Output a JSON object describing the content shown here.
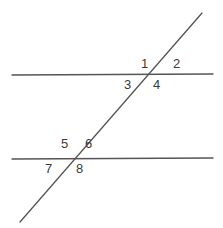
{
  "diagram": {
    "type": "geometry-figure",
    "background_color": "#ffffff",
    "line_color": "#555555",
    "label_color": "#3a3a3a",
    "lines": [
      {
        "name": "upper-parallel-line",
        "role": "parallel-line",
        "x1": 12,
        "y1": 75,
        "x2": 213,
        "y2": 74
      },
      {
        "name": "lower-parallel-line",
        "role": "parallel-line",
        "x1": 12,
        "y1": 159,
        "x2": 213,
        "y2": 158
      },
      {
        "name": "transversal-line",
        "role": "transversal",
        "x1": 20,
        "y1": 222,
        "x2": 202,
        "y2": 13
      }
    ],
    "intersections": [
      {
        "name": "upper-intersection",
        "x": 150,
        "y": 75
      },
      {
        "name": "lower-intersection",
        "x": 72,
        "y": 159
      }
    ],
    "labels": [
      {
        "id": "1",
        "text": "1",
        "x": 141,
        "y": 57,
        "position": "upper-left-of-upper-intersection"
      },
      {
        "id": "2",
        "text": "2",
        "x": 173,
        "y": 57,
        "position": "upper-right-of-upper-intersection"
      },
      {
        "id": "3",
        "text": "3",
        "x": 124,
        "y": 78,
        "position": "lower-left-of-upper-intersection"
      },
      {
        "id": "4",
        "text": "4",
        "x": 153,
        "y": 78,
        "position": "lower-right-of-upper-intersection"
      },
      {
        "id": "5",
        "text": "5",
        "x": 61,
        "y": 137,
        "position": "upper-left-of-lower-intersection"
      },
      {
        "id": "6",
        "text": "6",
        "x": 85,
        "y": 137,
        "position": "upper-right-of-lower-intersection"
      },
      {
        "id": "7",
        "text": "7",
        "x": 45,
        "y": 162,
        "position": "lower-left-of-lower-intersection"
      },
      {
        "id": "8",
        "text": "8",
        "x": 76,
        "y": 162,
        "position": "lower-right-of-lower-intersection"
      }
    ]
  }
}
